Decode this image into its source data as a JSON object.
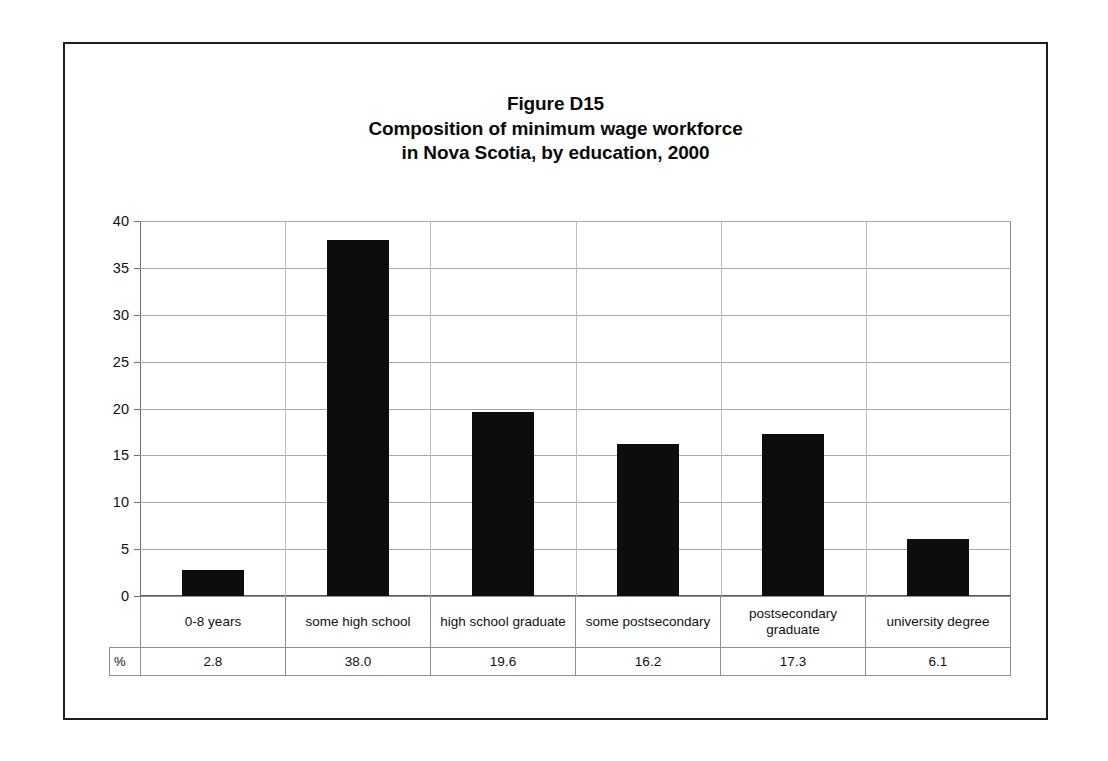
{
  "figure": {
    "title_lines": [
      "Figure D15",
      "Composition of minimum wage workforce",
      "in Nova Scotia, by education, 2000"
    ],
    "frame_color": "#1d1d1d",
    "bar_color": "#0d0d0d",
    "gridline_color": "#a9a9a9"
  },
  "table": {
    "stub_label": "%",
    "row_label_value": "%"
  },
  "chart_data": {
    "type": "bar",
    "xlabel": "",
    "ylabel": "",
    "unit": "%",
    "ylim": [
      0,
      40
    ],
    "ytick_labels": [
      "0",
      "5",
      "10",
      "15",
      "20",
      "25",
      "30",
      "35",
      "40"
    ],
    "yticks": [
      0,
      5,
      10,
      15,
      20,
      25,
      30,
      35,
      40
    ],
    "grid": true,
    "legend": false,
    "categories": [
      "0-8 years",
      "some high school",
      "high school graduate",
      "some postsecondary",
      "postsecondary graduate",
      "university degree"
    ],
    "values": [
      2.8,
      38.0,
      19.6,
      16.2,
      17.3,
      6.1
    ],
    "value_labels": [
      "2.8",
      "38.0",
      "19.6",
      "16.2",
      "17.3",
      "6.1"
    ]
  }
}
